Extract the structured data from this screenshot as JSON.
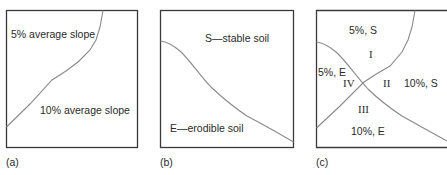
{
  "panels": {
    "a": {
      "caption": "(a)",
      "region_top": "5% average slope",
      "region_bottom": "10% average slope"
    },
    "b": {
      "caption": "(b)",
      "region_top": "S—stable soil",
      "region_bottom": "E—erodible soil"
    },
    "c": {
      "caption": "(c)",
      "label_5S": "5%, S",
      "label_5E": "5%, E",
      "label_10S": "10%, S",
      "label_10E": "10%, E",
      "zone_I": "I",
      "zone_II": "II",
      "zone_III": "III",
      "zone_IV": "IV"
    }
  },
  "colors": {
    "box_stroke": "#3a3a3a",
    "curve_stroke": "#8a8a8a",
    "text": "#2a2a2a"
  }
}
